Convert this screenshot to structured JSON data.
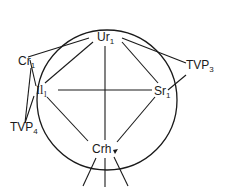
{
  "diagram": {
    "type": "circle-node-diagram",
    "stroke_color": "#1a1a1a",
    "background": "#ffffff",
    "nodes": [
      {
        "id": "ur1",
        "base": "Ur",
        "sub": "1"
      },
      {
        "id": "cr1",
        "base": "Cr",
        "sub": "1"
      },
      {
        "id": "il1",
        "base": "Il",
        "sub": "1"
      },
      {
        "id": "sr1",
        "base": "Sr",
        "sub": "1"
      },
      {
        "id": "crh",
        "base": "Crh",
        "sub": ""
      },
      {
        "id": "tvp3",
        "base": "TVP",
        "sub": "3"
      },
      {
        "id": "tvp4",
        "base": "TVP",
        "sub": "4"
      }
    ],
    "edges": [
      {
        "from": "ur1",
        "to": "crh"
      },
      {
        "from": "il1",
        "to": "sr1"
      },
      {
        "from": "ur1",
        "to": "cr1"
      },
      {
        "from": "ur1",
        "to": "il1"
      },
      {
        "from": "ur1",
        "to": "tvp3"
      },
      {
        "from": "ur1",
        "to": "sr1"
      },
      {
        "from": "cr1",
        "to": "tvp4"
      },
      {
        "from": "il1",
        "to": "crh"
      },
      {
        "from": "sr1",
        "to": "crh"
      }
    ]
  }
}
